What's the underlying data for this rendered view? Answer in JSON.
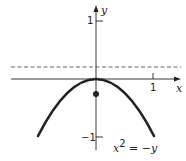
{
  "diagram": {
    "type": "parabola-plot",
    "equation": {
      "base": "x",
      "exp": "2",
      "rhs": " = −y"
    },
    "axes": {
      "x_label": "x",
      "y_label": "y",
      "x_ticks": [
        {
          "value": 1,
          "label": "1"
        }
      ],
      "y_ticks": [
        {
          "value": 1,
          "label": "1"
        },
        {
          "value": -1,
          "label": "−1"
        }
      ]
    },
    "directrix": {
      "y": 0.25,
      "style": "dashed"
    },
    "focus": {
      "x": 0,
      "y": -0.25
    },
    "curve": {
      "function": "y = -x^2",
      "x_range": [
        -1.23,
        1.23
      ]
    },
    "colors": {
      "ink": "#222222",
      "dashed": "#555555",
      "background": "#ffffff"
    }
  }
}
